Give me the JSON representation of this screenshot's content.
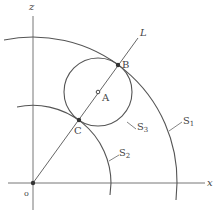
{
  "diagram": {
    "type": "geometry",
    "axes": {
      "horizontal_label": "x",
      "vertical_label": "z",
      "origin_label": "o"
    },
    "line": {
      "label": "L"
    },
    "points": [
      {
        "label": "A"
      },
      {
        "label": "B"
      },
      {
        "label": "C"
      }
    ],
    "curves": [
      {
        "label": "S",
        "subscript": "1",
        "kind": "arc"
      },
      {
        "label": "S",
        "subscript": "2",
        "kind": "arc"
      },
      {
        "label": "S",
        "subscript": "3",
        "kind": "circle"
      }
    ],
    "colors": {
      "stroke": "#555555",
      "text": "#444444"
    }
  }
}
